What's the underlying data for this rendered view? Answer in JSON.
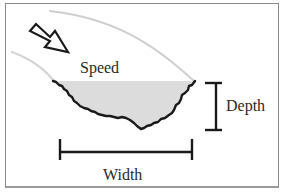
{
  "diagram": {
    "labels": {
      "speed": "Speed",
      "depth": "Depth",
      "width": "Width"
    },
    "colors": {
      "frame_border": "#8a8a8a",
      "outline": "#1a1a1a",
      "channel_fill": "#dcdcdc",
      "flow_lines": "#cfcfcf",
      "text": "#2a2a2a"
    },
    "elements": [
      "flow-direction-arrow",
      "upper-flow-curve",
      "lower-flow-curve",
      "channel-cross-section",
      "depth-bracket",
      "width-bracket"
    ]
  }
}
